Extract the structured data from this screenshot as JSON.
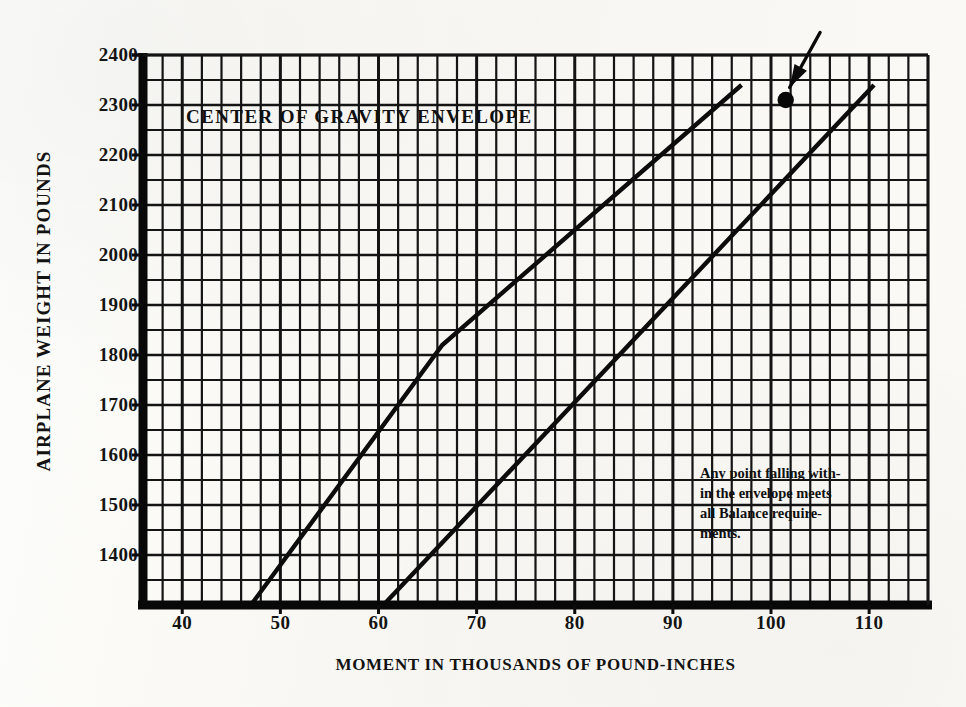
{
  "chart_data": {
    "type": "line",
    "title": "CENTER OF GRAVITY ENVELOPE",
    "xlabel": "MOMENT IN THOUSANDS OF POUND-INCHES",
    "ylabel": "AIRPLANE WEIGHT IN POUNDS",
    "xlim": [
      36,
      116
    ],
    "ylim": [
      1300,
      2400
    ],
    "grid": true,
    "x_major_ticks": [
      40,
      50,
      60,
      70,
      80,
      90,
      100,
      110
    ],
    "x_tick_labels": [
      "40",
      "50",
      "60",
      "70",
      "80",
      "90",
      "100",
      "110"
    ],
    "x_minor_step": 2,
    "y_major_ticks": [
      1400,
      1500,
      1600,
      1700,
      1800,
      1900,
      2000,
      2100,
      2200,
      2300,
      2400
    ],
    "y_tick_labels": [
      "1400",
      "1500",
      "1600",
      "1700",
      "1800",
      "1900",
      "2000",
      "2100",
      "2200",
      "2300",
      "2400"
    ],
    "y_minor_step": 50,
    "legend": null,
    "series": [
      {
        "name": "forward-cg-limit",
        "points": [
          [
            47.0,
            1300
          ],
          [
            66.5,
            1820
          ],
          [
            97.0,
            2340
          ]
        ]
      },
      {
        "name": "aft-cg-limit",
        "points": [
          [
            60.5,
            1300
          ],
          [
            110.5,
            2340
          ]
        ]
      }
    ],
    "points": [
      {
        "name": "loaded-airplane-point",
        "x": 101.5,
        "y": 2310,
        "marker": "filled-circle"
      }
    ],
    "annotations": [
      {
        "name": "point-arrow",
        "from": [
          105.0,
          2445
        ],
        "to": [
          101.9,
          2335
        ]
      }
    ],
    "note_lines": [
      "Any point falling with-",
      "in the envelope meets",
      "all   Balance   require-",
      "ments."
    ],
    "note_text": "Any point falling within the envelope meets all Balance requirements."
  }
}
